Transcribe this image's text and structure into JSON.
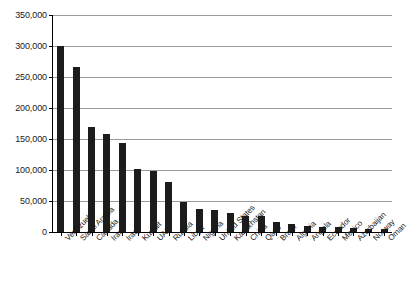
{
  "chart_data": {
    "type": "bar",
    "title": "",
    "subtitle": "",
    "xlabel": "",
    "ylabel": "",
    "ylim": [
      0,
      350000
    ],
    "grid": true,
    "legend": false,
    "categories": [
      "Venezuela",
      "Saudi Arabia",
      "Canada",
      "Iran",
      "Iraq",
      "Kuwait",
      "UAE",
      "Russia",
      "Libya",
      "Nigeria",
      "United States",
      "Kazakhstan",
      "China",
      "Qatar",
      "Brazil",
      "Algeria",
      "Angola",
      "Ecuador",
      "Mexico",
      "Azerbaijan",
      "Norway",
      "Oman"
    ],
    "values": [
      300000,
      266000,
      169000,
      158000,
      143000,
      101500,
      97800,
      80000,
      48400,
      37100,
      35000,
      30000,
      25600,
      25200,
      16200,
      12200,
      9500,
      8300,
      7600,
      7000,
      5500,
      5400
    ],
    "ytick_labels": [
      "350,000",
      "300,000",
      "250,000",
      "200,000",
      "150,000",
      "100,000",
      "50,000",
      "0"
    ],
    "ytick_values": [
      350000,
      300000,
      250000,
      200000,
      150000,
      100000,
      50000,
      0
    ],
    "bar_color": "#1c1c1c",
    "grid_color": "#9a9a9a",
    "axis_color": "#000000",
    "background_color": "#ffffff"
  }
}
